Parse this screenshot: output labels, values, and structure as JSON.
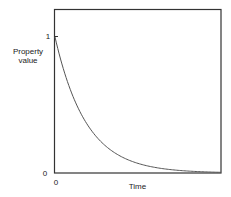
{
  "chart_data": {
    "type": "line",
    "title": "",
    "xlabel": "Time",
    "ylabel": "Property value",
    "ylabel_lines": [
      "Property",
      "value"
    ],
    "x_ticks": [
      "0"
    ],
    "y_ticks": [
      "0",
      "1"
    ],
    "xlim": [
      0,
      1
    ],
    "ylim": [
      0,
      1.2
    ],
    "grid": false,
    "legend": null,
    "series": [
      {
        "name": "Property value (exponential decay)",
        "function": "y = exp(-5.3 * x)",
        "x": [
          0,
          0.05,
          0.1,
          0.15,
          0.2,
          0.3,
          0.4,
          0.5,
          0.6,
          0.7,
          0.8,
          0.9,
          1.0
        ],
        "y": [
          1.0,
          0.77,
          0.59,
          0.45,
          0.35,
          0.2,
          0.12,
          0.07,
          0.04,
          0.024,
          0.014,
          0.008,
          0.005
        ]
      }
    ],
    "colors": {
      "curve": "#555555",
      "frame": "#333333",
      "text": "#222222"
    }
  }
}
